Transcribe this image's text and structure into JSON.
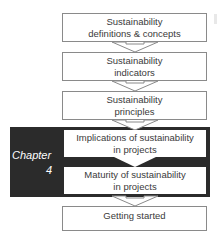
{
  "diagram": {
    "type": "flowchart",
    "direction": "top-to-bottom",
    "steps": [
      {
        "line1": "Sustainability",
        "line2": "definitions & concepts"
      },
      {
        "line1": "Sustainability",
        "line2": "indicators"
      },
      {
        "line1": "Sustainability",
        "line2": "principles"
      },
      {
        "line1": "Implications of sustainability",
        "line2": "in projects"
      },
      {
        "line1": "Maturity of sustainability",
        "line2": "in projects"
      },
      {
        "line1": "Getting started",
        "line2": ""
      }
    ],
    "highlight": {
      "label_line1": "Chapter",
      "label_line2": "4",
      "covers_steps": [
        4,
        5
      ],
      "color": "#2b2b2b",
      "text_color": "#ffffff"
    },
    "colors": {
      "box_border": "#8a8a8a",
      "box_fill": "#ffffff",
      "text": "#3a3a3a"
    }
  }
}
